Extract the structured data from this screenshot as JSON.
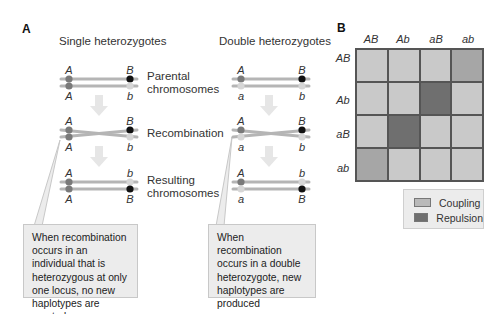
{
  "panel_a": {
    "letter": "A",
    "single": {
      "title": "Single heterozygotes",
      "parental": {
        "top": [
          "A",
          "B"
        ],
        "bottom": [
          "A",
          "b"
        ]
      },
      "recombination": {
        "top": [
          "A",
          "B"
        ],
        "bottom": [
          "A",
          "b"
        ]
      },
      "resulting": {
        "top": [
          "A",
          "b"
        ],
        "bottom": [
          "A",
          "B"
        ]
      },
      "callout": "When recombination occurs in an individual that is heterozygous at only one locus, no new haplotypes are created"
    },
    "double": {
      "title": "Double heterozygotes",
      "parental": {
        "top": [
          "A",
          "B"
        ],
        "bottom": [
          "a",
          "b"
        ]
      },
      "recombination": {
        "top": [
          "A",
          "B"
        ],
        "bottom": [
          "a",
          "b"
        ]
      },
      "resulting": {
        "top": [
          "A",
          "b"
        ],
        "bottom": [
          "a",
          "B"
        ]
      },
      "callout": "When recombination occurs in a double heterozygote, new haplotypes are produced"
    },
    "stages": {
      "parental_line1": "Parental",
      "parental_line2": "chromosomes",
      "recombination": "Recombination",
      "resulting_line1": "Resulting",
      "resulting_line2": "chromosomes"
    }
  },
  "panel_b": {
    "letter": "B",
    "columns": [
      "AB",
      "Ab",
      "aB",
      "ab"
    ],
    "rows": [
      "AB",
      "Ab",
      "aB",
      "ab"
    ],
    "cells": [
      [
        "light",
        "light",
        "light",
        "medium"
      ],
      [
        "light",
        "light",
        "dark",
        "light"
      ],
      [
        "light",
        "dark",
        "light",
        "light"
      ],
      [
        "medium",
        "light",
        "light",
        "light"
      ]
    ],
    "legend": [
      {
        "label": "Coupling",
        "color": "#b9b9b9"
      },
      {
        "label": "Repulsion",
        "color": "#6f6f6f"
      }
    ]
  },
  "colors": {
    "cell_light": "#c9c9c9",
    "cell_medium": "#a6a6a6",
    "cell_dark": "#6f6f6f",
    "chromosome_line": "#b5b5b5",
    "allele_dark": "#111111",
    "allele_mid": "#7a7a7a",
    "allele_light": "#d6d6d6",
    "arrow": "#e3e3e3"
  }
}
